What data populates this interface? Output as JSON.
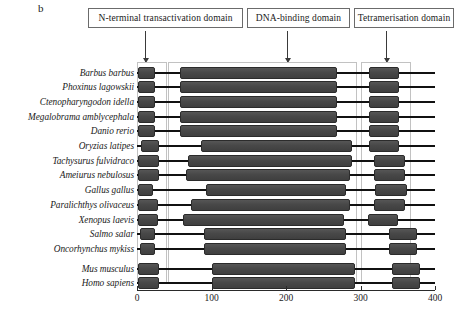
{
  "panel": {
    "letter": "b"
  },
  "domain_labels": [
    {
      "name": "n-terminal",
      "text": "N-terminal transactivation domain"
    },
    {
      "name": "dna-binding",
      "text": "DNA-binding domain"
    },
    {
      "name": "tetramerisation",
      "text": "Tetramerisation domain"
    }
  ],
  "axis": {
    "ticks": [
      0,
      100,
      200,
      300,
      400
    ],
    "min": 0,
    "max": 400
  },
  "chart_data": {
    "type": "bar",
    "title": "",
    "subtitle": "",
    "xlabel": "",
    "ylabel": "",
    "xlim": [
      0,
      400
    ],
    "grid": false,
    "legend": [
      "N-terminal transactivation domain",
      "DNA-binding domain",
      "Tetramerisation domain"
    ],
    "legend_position": "top",
    "annotations": [
      "b"
    ],
    "categories": [
      "Barbus barbus",
      "Phoxinus lagowskii",
      "Ctenopharyngodon idella",
      "Megalobrama amblycephala",
      "Danio rerio",
      "Oryzias latipes",
      "Tachysurus fulvidraco",
      "Ameiurus nebulosus",
      "Gallus gallus",
      "Paralichthys olivaceus",
      "Xenopus laevis",
      "Salmo salar",
      "Oncorhynchus mykiss",
      "Mus musculus",
      "Homo sapiens"
    ],
    "series": [
      {
        "name": "protein_length",
        "values": [
          400,
          400,
          400,
          400,
          400,
          400,
          400,
          400,
          400,
          400,
          400,
          400,
          400,
          400,
          400
        ]
      },
      {
        "name": "N-terminal transactivation domain",
        "start": [
          2,
          2,
          2,
          2,
          2,
          6,
          2,
          2,
          2,
          2,
          2,
          4,
          4,
          2,
          2
        ],
        "end": [
          24,
          24,
          24,
          24,
          24,
          30,
          30,
          30,
          22,
          28,
          28,
          24,
          24,
          30,
          30
        ]
      },
      {
        "name": "DNA-binding domain",
        "start": [
          58,
          58,
          58,
          58,
          58,
          86,
          68,
          66,
          92,
          72,
          62,
          90,
          90,
          100,
          100
        ],
        "end": [
          268,
          268,
          268,
          268,
          268,
          288,
          288,
          286,
          280,
          286,
          278,
          280,
          280,
          292,
          292
        ]
      },
      {
        "name": "Tetramerisation domain",
        "start": [
          312,
          312,
          312,
          312,
          312,
          312,
          318,
          318,
          320,
          318,
          310,
          338,
          338,
          342,
          342
        ],
        "end": [
          352,
          352,
          352,
          352,
          352,
          352,
          360,
          360,
          362,
          360,
          350,
          376,
          376,
          380,
          380
        ]
      }
    ]
  }
}
